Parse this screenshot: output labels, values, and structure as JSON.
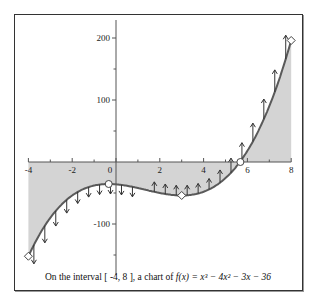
{
  "caption": {
    "prefix": "On the interval",
    "interval": "[ -4, 8 ]",
    "middle": ", a chart of",
    "function": "f(x) = x³ − 4x² − 3x − 36"
  },
  "colors": {
    "curve": "#5a5a5a",
    "fill": "#d4d4d4",
    "axis": "#555555",
    "arrows": "#333333"
  },
  "chart_data": {
    "type": "line",
    "function": "x^3 - 4*x^2 - 3*x - 36",
    "xlim": [
      -4,
      8
    ],
    "ylim": [
      -160,
      230
    ],
    "xticks": [
      -4,
      -2,
      0,
      2,
      4,
      6,
      8
    ],
    "xtick_labels": [
      "-4",
      "-2",
      "0",
      "2",
      "4",
      "6",
      "8"
    ],
    "yticks": [
      -100,
      100,
      200
    ],
    "ytick_labels": [
      "-100",
      "100",
      "200"
    ],
    "grid": false,
    "shaded_region": "between curve and x-axis",
    "x": [
      -4,
      -3,
      -2,
      -1,
      -0.333,
      0,
      1,
      2,
      3,
      4,
      5,
      5.68,
      6,
      7,
      8
    ],
    "y": [
      -152,
      -90,
      -50,
      -34,
      -35.5,
      -36,
      -42,
      -50,
      -54,
      -48,
      -26,
      0,
      10,
      76,
      196
    ],
    "markers": [
      {
        "label": "left endpoint",
        "x": -4,
        "y": -152,
        "shape": "diamond"
      },
      {
        "label": "local maximum",
        "x": -0.333,
        "y": -35.5,
        "shape": "circle"
      },
      {
        "label": "local minimum",
        "x": 3,
        "y": -54,
        "shape": "diamond"
      },
      {
        "label": "root",
        "x": 5.68,
        "y": 0,
        "shape": "circle"
      },
      {
        "label": "right endpoint",
        "x": 8,
        "y": 196,
        "shape": "diamond"
      }
    ],
    "arrows": {
      "meaning": "concavity f''(x) = 6x - 8, down for x < 4/3, up for x > 4/3",
      "x_positions": [
        -3.75,
        -3.25,
        -2.75,
        -2.25,
        -1.75,
        -1.25,
        -0.75,
        -0.25,
        0.25,
        0.75,
        1.75,
        2.25,
        2.75,
        3.25,
        3.75,
        4.25,
        4.75,
        5.25,
        5.75,
        6.25,
        6.75,
        7.25,
        7.75
      ]
    }
  }
}
